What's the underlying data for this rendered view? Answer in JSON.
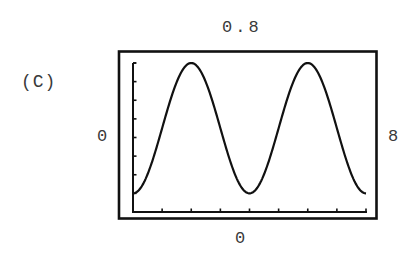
{
  "panel": {
    "label": "(C)"
  },
  "axes": {
    "y_max_label": "0.8",
    "y_min_label": "0",
    "x_min_label": "0",
    "x_max_label": "8"
  },
  "colors": {
    "line": "#111111",
    "frame": "#111111",
    "text": "#3a3a3a",
    "background": "#ffffff"
  },
  "chart_data": {
    "type": "line",
    "title": "(C)",
    "xlabel": "",
    "ylabel": "",
    "xlim": [
      0,
      8
    ],
    "ylim": [
      0,
      0.8
    ],
    "x_tick_step": 1,
    "y_tick_step": 0.1,
    "grid": false,
    "legend": null,
    "annotations": [
      "0.8 (y max, top)",
      "0 (y min, left)",
      "0 (x min, bottom)",
      "8 (x max, right)"
    ],
    "series": [
      {
        "name": "curve",
        "x": [
          0,
          0.5,
          1,
          1.5,
          2,
          2.5,
          3,
          3.5,
          4,
          4.5,
          5,
          5.5,
          6,
          6.5,
          7,
          7.5,
          8
        ],
        "values": [
          0.1,
          0.2,
          0.45,
          0.7,
          0.8,
          0.7,
          0.45,
          0.2,
          0.1,
          0.2,
          0.45,
          0.7,
          0.8,
          0.7,
          0.45,
          0.2,
          0.1
        ]
      }
    ]
  }
}
